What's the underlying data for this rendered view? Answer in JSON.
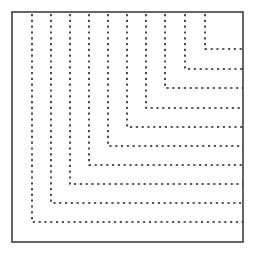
{
  "diagram": {
    "type": "nested-l-shaped-dashed-lines",
    "frame": {
      "x": 12,
      "y": 12,
      "width": 231,
      "height": 230,
      "stroke": "#333333"
    },
    "line_color": "#222222",
    "lines": [
      {
        "x": 32,
        "y": 222
      },
      {
        "x": 51,
        "y": 203
      },
      {
        "x": 70,
        "y": 184
      },
      {
        "x": 89,
        "y": 165
      },
      {
        "x": 108,
        "y": 146
      },
      {
        "x": 127,
        "y": 127
      },
      {
        "x": 146,
        "y": 108
      },
      {
        "x": 165,
        "y": 88
      },
      {
        "x": 185,
        "y": 69
      },
      {
        "x": 205,
        "y": 49
      }
    ]
  }
}
